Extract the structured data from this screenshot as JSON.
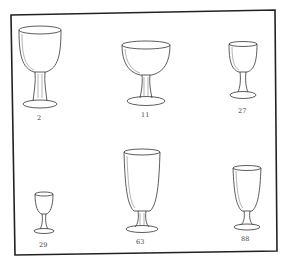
{
  "page": {
    "frame_color": "#222222",
    "background": "#ffffff"
  },
  "glasses": [
    {
      "label": "2"
    },
    {
      "label": "11"
    },
    {
      "label": "27"
    },
    {
      "label": "29"
    },
    {
      "label": "63"
    },
    {
      "label": "88"
    }
  ]
}
